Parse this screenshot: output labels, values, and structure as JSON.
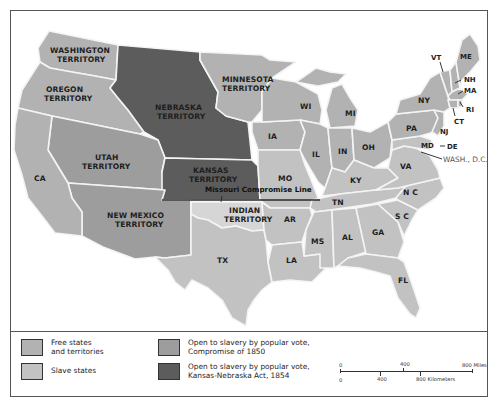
{
  "colors": {
    "free": "#b2b2b2",
    "slave": "#c2c2c2",
    "compromise_1850": "#9d9d9d",
    "kansas_nebraska_1854": "#5c5c5c",
    "indian_territory": "#d6d6d6",
    "border": "#f4f4f4",
    "frame": "#555555"
  },
  "map": {
    "territories": [
      {
        "name": "WASHINGTON",
        "line2": "TERRITORY",
        "status": "free"
      },
      {
        "name": "OREGON",
        "line2": "TERRITORY",
        "status": "free"
      },
      {
        "name": "MINNESOTA",
        "line2": "TERRITORY",
        "status": "free"
      },
      {
        "name": "NEBRASKA",
        "line2": "TERRITORY",
        "status": "kansas_nebraska_1854"
      },
      {
        "name": "KANSAS",
        "line2": "TERRITORY",
        "status": "kansas_nebraska_1854"
      },
      {
        "name": "UTAH",
        "line2": "TERRITORY",
        "status": "compromise_1850"
      },
      {
        "name": "NEW MEXICO",
        "line2": "TERRITORY",
        "status": "compromise_1850"
      },
      {
        "name": "INDIAN",
        "line2": "TERRITORY",
        "status": "other"
      }
    ],
    "states": {
      "CA": "CA",
      "TX": "TX",
      "IA": "IA",
      "WI": "WI",
      "MI": "MI",
      "IL": "IL",
      "IN": "IN",
      "OH": "OH",
      "MO": "MO",
      "AR": "AR",
      "LA": "LA",
      "KY": "KY",
      "TN": "TN",
      "MS": "MS",
      "AL": "AL",
      "GA": "GA",
      "FL": "FL",
      "SC": "S C",
      "NC": "N C",
      "VA": "VA",
      "PA": "PA",
      "NY": "NY",
      "VT": "VT",
      "ME": "ME",
      "NH": "NH",
      "MA": "MA",
      "RI": "RI",
      "CT": "CT",
      "NJ": "NJ",
      "DE": "DE",
      "MD": "MD"
    },
    "capital_label": "WASH., D.C.",
    "missouri_compromise_label": "Missouri Compromise Line"
  },
  "legend": {
    "items": [
      {
        "label_line1": "Free states",
        "label_line2": "and territories",
        "color_key": "free"
      },
      {
        "label_line1": "Slave states",
        "label_line2": "",
        "color_key": "slave"
      },
      {
        "label_line1": "Open to slavery by popular vote,",
        "label_line2": "Compromise of 1850",
        "color_key": "compromise_1850"
      },
      {
        "label_line1": "Open to slavery by popular vote,",
        "label_line2": "Kansas-Nebraska Act, 1854",
        "color_key": "kansas_nebraska_1854"
      }
    ]
  },
  "scale_bar": {
    "miles": {
      "start": "0",
      "mid": "400",
      "end": "800 Miles"
    },
    "kilometers": {
      "start": "0",
      "mid": "400",
      "end": "800 Kilometers"
    }
  }
}
